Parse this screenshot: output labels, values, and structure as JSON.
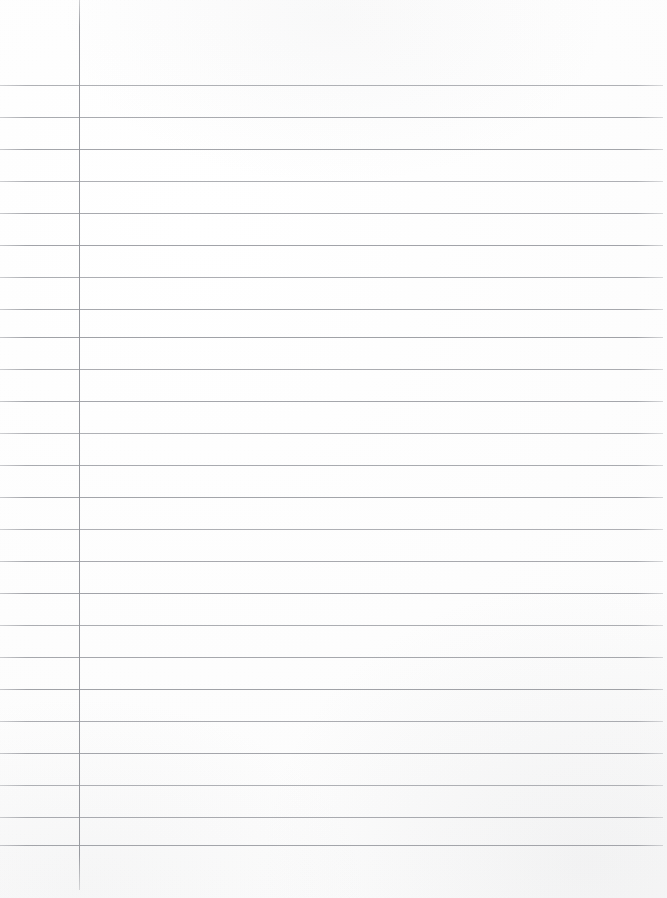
{
  "document": {
    "kind": "lined-notebook-paper-scan",
    "content_text": "",
    "page_width": 667,
    "page_height": 898,
    "background_color": "#fdfdfd"
  },
  "ruling": {
    "line_color": "#96989e",
    "margin_line_color": "#92949a",
    "horizontal_line_count": 24,
    "first_line_y": 85,
    "line_spacing": 32,
    "last_line_y": 845,
    "line_left_x": 0,
    "line_right_x": 663,
    "margin_line_x": 79,
    "margin_line_top_y": 0,
    "margin_line_bottom_y": 890,
    "horizontal_line_y": [
      85,
      117,
      149,
      181,
      213,
      245,
      277,
      309,
      337,
      369,
      401,
      433,
      465,
      497,
      529,
      561,
      593,
      625,
      657,
      689,
      721,
      753,
      785,
      817,
      845
    ]
  },
  "regions": {
    "margin_label": "left-margin",
    "body_label": "writing-area",
    "header_label": "header-area"
  }
}
